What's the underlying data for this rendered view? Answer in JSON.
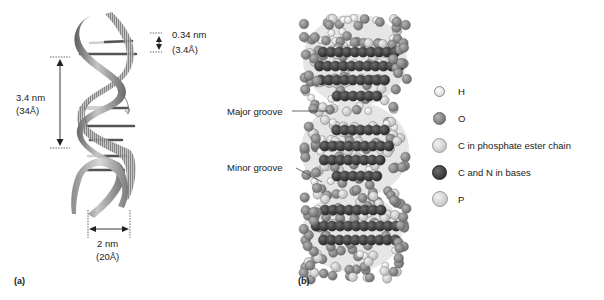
{
  "panel_a": {
    "label": "(a)",
    "rise_per_base": {
      "nm": "0.34 nm",
      "angstrom": "(3.4Å)"
    },
    "pitch": {
      "nm": "3.4 nm",
      "angstrom": "(34Å)"
    },
    "diameter": {
      "nm": "2 nm",
      "angstrom": "(20Å)"
    }
  },
  "panel_b": {
    "label": "(b)",
    "callouts": {
      "major_groove": "Major groove",
      "minor_groove": "Minor groove"
    },
    "legend": [
      {
        "label": "H",
        "color": "#f2f2f2",
        "size": 9
      },
      {
        "label": "O",
        "color": "#8a8a8a",
        "size": 11
      },
      {
        "label": "C in phosphate ester chain",
        "color": "#d9d9d9",
        "size": 13
      },
      {
        "label": "C and N in bases",
        "color": "#3a3a3a",
        "size": 13
      },
      {
        "label": "P",
        "color": "#cfcfcf",
        "size": 14
      }
    ]
  },
  "colors": {
    "ribbon_light": "#b5b5b5",
    "ribbon_dark": "#6e6e6e",
    "base_dark": "#3a3a3a",
    "atom_O": "#8a8a8a",
    "atom_H": "#f2f2f2",
    "atom_C_backbone": "#d9d9d9",
    "atom_base": "#3a3a3a"
  }
}
